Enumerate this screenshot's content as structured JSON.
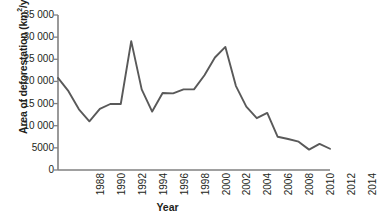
{
  "chart_data": {
    "type": "line",
    "title": "",
    "xlabel": "Year",
    "ylabel": "Area of deforestation (km²/yr)",
    "ylabel_main": "Area of deforestation (km",
    "ylabel_sup": "2",
    "ylabel_tail": "/yr)",
    "x": [
      1988,
      1989,
      1990,
      1991,
      1992,
      1993,
      1994,
      1995,
      1996,
      1997,
      1998,
      1999,
      2000,
      2001,
      2002,
      2003,
      2004,
      2005,
      2006,
      2007,
      2008,
      2009,
      2010,
      2011,
      2012,
      2013,
      2014
    ],
    "values": [
      20800,
      17800,
      13700,
      11000,
      13800,
      14900,
      14900,
      29100,
      18200,
      13200,
      17400,
      17300,
      18200,
      18200,
      21400,
      25400,
      27800,
      19000,
      14300,
      11700,
      12900,
      7500,
      7000,
      6400,
      4600,
      5900,
      4800
    ],
    "series": [
      {
        "name": "Area of deforestation",
        "color": "#595959",
        "values": [
          20800,
          17800,
          13700,
          11000,
          13800,
          14900,
          14900,
          29100,
          18200,
          13200,
          17400,
          17300,
          18200,
          18200,
          21400,
          25400,
          27800,
          19000,
          14300,
          11700,
          12900,
          7500,
          7000,
          6400,
          4600,
          5900,
          4800
        ]
      }
    ],
    "xlim": [
      1988,
      2014
    ],
    "ylim": [
      0,
      35000
    ],
    "yticks": [
      0,
      5000,
      10000,
      15000,
      20000,
      25000,
      30000,
      35000
    ],
    "ytick_labels": [
      "0",
      "5000",
      "10 000",
      "15 000",
      "20 000",
      "25 000",
      "30 000",
      "35 000"
    ],
    "xticks": [
      1988,
      1990,
      1992,
      1994,
      1996,
      1998,
      2000,
      2002,
      2004,
      2006,
      2008,
      2010,
      2012,
      2014
    ],
    "xtick_labels": [
      "1988",
      "1990",
      "1992",
      "1994",
      "1996",
      "1998",
      "2000",
      "2002",
      "2004",
      "2006",
      "2008",
      "2010",
      "2012",
      "2014"
    ],
    "grid": false,
    "legend": false,
    "legend_position": "none",
    "line_color": "#595959",
    "axis_color": "#808080",
    "text_color": "#231f20"
  }
}
